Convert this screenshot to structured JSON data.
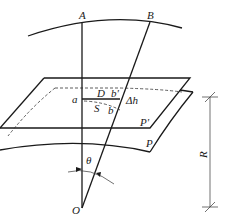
{
  "diagram": {
    "labels": {
      "A": "A",
      "B": "B",
      "a": "a",
      "D": "D",
      "b_prime": "b'",
      "delta_h": "Δh",
      "S": "S",
      "b": "b",
      "P_prime": "P'",
      "P": "P",
      "theta": "θ",
      "O": "O",
      "R": "R"
    },
    "colors": {
      "stroke": "#1a1a1a",
      "background": "#ffffff"
    }
  }
}
